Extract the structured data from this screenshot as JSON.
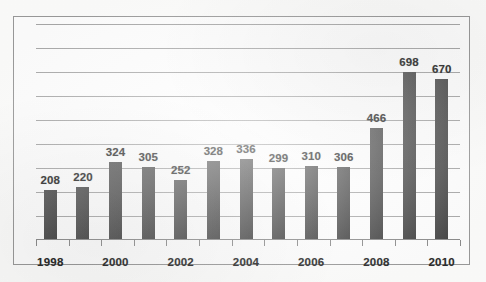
{
  "chart_data": {
    "type": "bar",
    "title": "",
    "subtitle": "",
    "xlabel": "",
    "ylabel": "",
    "categories": [
      "1998",
      "1999",
      "2000",
      "2001",
      "2002",
      "2003",
      "2004",
      "2005",
      "2006",
      "2007",
      "2008",
      "2009",
      "2010"
    ],
    "values": [
      208,
      220,
      324,
      305,
      252,
      328,
      336,
      299,
      310,
      306,
      466,
      698,
      670
    ],
    "data_labels": [
      "208",
      "220",
      "324",
      "305",
      "252",
      "328",
      "336",
      "299",
      "310",
      "306",
      "466",
      "698",
      "670"
    ],
    "visible_tick_labels": [
      "1998",
      "2000",
      "2002",
      "2004",
      "2006",
      "2008",
      "2010"
    ],
    "ylim": [
      0,
      900
    ],
    "gridline_values": [
      100,
      200,
      300,
      400,
      500,
      600,
      700,
      800,
      900
    ],
    "grid": true,
    "legend": "none",
    "series": [
      {
        "name": "series-1",
        "values": [
          208,
          220,
          324,
          305,
          252,
          328,
          336,
          299,
          310,
          306,
          466,
          698,
          670
        ]
      }
    ],
    "colors": {
      "bar": "#4b4b4b",
      "gridline": "#a8a8a8",
      "axis": "#8d8d8d",
      "frame": "#9a9a9a",
      "background": "#fefefe",
      "label_text": "#2c2c2c"
    }
  }
}
